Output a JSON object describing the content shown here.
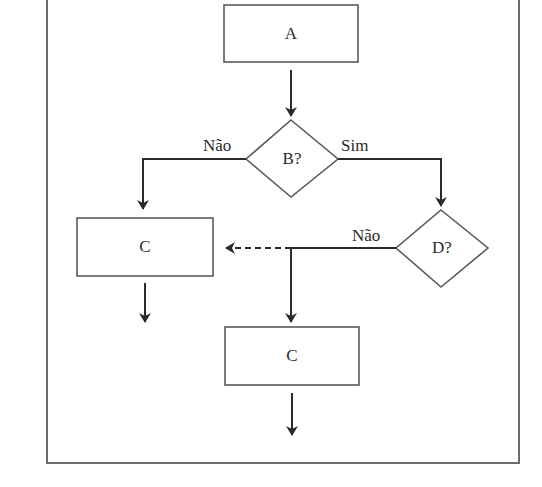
{
  "diagram": {
    "type": "flowchart",
    "colors": {
      "stroke": "#5a5a5a",
      "edge": "#2a2a2a",
      "frame": "#6a6a6a",
      "background": "#ffffff"
    },
    "nodes": {
      "a": {
        "shape": "rectangle",
        "label": "A"
      },
      "b": {
        "shape": "diamond",
        "label": "B?"
      },
      "c_left": {
        "shape": "rectangle",
        "label": "C"
      },
      "d": {
        "shape": "diamond",
        "label": "D?"
      },
      "c_bottom": {
        "shape": "rectangle",
        "label": "C"
      }
    },
    "edges": {
      "a_to_b": {
        "from": "A",
        "to": "B?",
        "label": "",
        "style": "solid"
      },
      "b_no": {
        "from": "B?",
        "to": "C (left)",
        "label": "Não",
        "style": "solid"
      },
      "b_yes": {
        "from": "B?",
        "to": "D?",
        "label": "Sim",
        "style": "solid"
      },
      "d_no": {
        "from": "D?",
        "to": "C (bottom)",
        "label": "Não",
        "style": "solid"
      },
      "d_no_dashed": {
        "from": "D? branch",
        "to": "C (left)",
        "label": "",
        "style": "dashed"
      },
      "c_left_out": {
        "from": "C (left)",
        "to": "",
        "label": "",
        "style": "solid"
      },
      "c_bottom_out": {
        "from": "C (bottom)",
        "to": "",
        "label": "",
        "style": "solid"
      }
    }
  }
}
